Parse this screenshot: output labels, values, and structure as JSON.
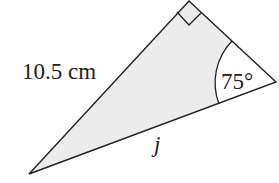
{
  "diagram": {
    "type": "right-triangle",
    "fill_color": "#ececec",
    "stroke_color": "#222222",
    "vertices": {
      "top": [
        189,
        1
      ],
      "right": [
        276,
        82
      ],
      "bottom_left": [
        29,
        174
      ]
    },
    "right_angle_marker": {
      "vertex": "top",
      "shown": true
    },
    "labels": {
      "hypotenuse_side": "10.5 cm",
      "angle": "75°",
      "unknown_side": "j"
    }
  }
}
